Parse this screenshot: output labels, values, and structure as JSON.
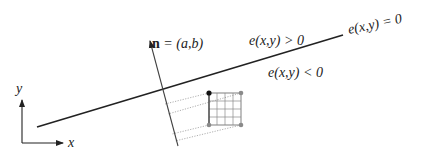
{
  "diagram": {
    "labels": {
      "normal_bold": "n",
      "normal_rest": " = (a,b)",
      "positive": "e(x,y) > 0",
      "negative": "e(x,y) < 0",
      "zero": "e(x,y) = 0",
      "axis_x": "x",
      "axis_y": "y"
    },
    "colors": {
      "line": "#222222",
      "grid": "#808080",
      "dotted": "#9a9a9a",
      "corner_dark": "#111111",
      "corner_light": "#8a8a8a"
    },
    "geometry": {
      "edge_line": {
        "x1": 37,
        "y1": 127,
        "x2": 343,
        "y2": 35
      },
      "normal_arrow": {
        "x1": 178,
        "y1": 146,
        "x2": 149,
        "y2": 38
      },
      "axes_origin": {
        "x": 22,
        "y": 143
      },
      "tile": {
        "x": 209,
        "y": 93,
        "size": 32,
        "divisions": 4
      }
    }
  }
}
